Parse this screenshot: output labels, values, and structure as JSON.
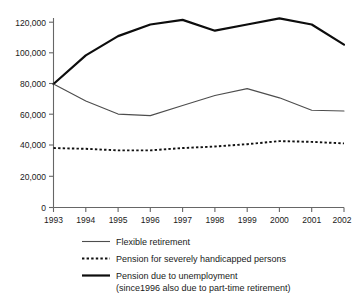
{
  "chart_data": {
    "type": "line",
    "title": "",
    "subtitle": "",
    "xlabel": "",
    "ylabel": "",
    "x": [
      "1993",
      "1994",
      "1995",
      "1996",
      "1997",
      "1998",
      "1999",
      "2000",
      "2001",
      "2002"
    ],
    "categories": [
      "1993",
      "1994",
      "1995",
      "1996",
      "1997",
      "1998",
      "1999",
      "2000",
      "2001",
      "2002"
    ],
    "xlim": [
      "1993",
      "2002"
    ],
    "ylim": [
      0,
      120000
    ],
    "y_ticks": [
      0,
      20000,
      40000,
      60000,
      80000,
      100000,
      120000
    ],
    "y_tick_labels": [
      "0",
      "20,000",
      "40,000",
      "60,000",
      "80,000",
      "100,000",
      "120,000"
    ],
    "grid": false,
    "legend_position": "bottom",
    "series": [
      {
        "name": "Flexible retirement",
        "style": "thin-solid",
        "color": "#4d4d4d",
        "values": [
          80000,
          69000,
          60500,
          59500,
          66000,
          72500,
          77000,
          71000,
          63000,
          62500
        ]
      },
      {
        "name": "Pension for severely handicapped persons",
        "style": "dotted",
        "color": "#111111",
        "values": [
          38500,
          38000,
          37000,
          37000,
          38500,
          39500,
          41000,
          43000,
          42500,
          41500
        ]
      },
      {
        "name": "Pension due to unemployment",
        "style": "thick-solid",
        "color": "#0d0d0d",
        "values": [
          80000,
          98500,
          111000,
          118500,
          121500,
          114500,
          118500,
          122500,
          118500,
          105500
        ]
      }
    ]
  },
  "legend": {
    "entries": [
      {
        "label": "Flexible retirement",
        "sublabel": "",
        "sample": "thin-solid-line-icon"
      },
      {
        "label": "Pension for severely handicapped persons",
        "sublabel": "",
        "sample": "dotted-line-icon"
      },
      {
        "label": "Pension due to unemployment",
        "sublabel": "(since1996 also due to part-time retirement)",
        "sample": "thick-solid-line-icon"
      }
    ]
  }
}
